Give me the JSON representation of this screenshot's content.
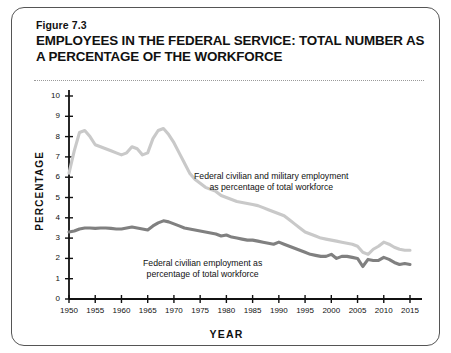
{
  "figure": {
    "number": "Figure 7.3",
    "title": "EMPLOYEES IN THE FEDERAL SERVICE: TOTAL NUMBER AS A PERCENTAGE OF THE WORKFORCE"
  },
  "colors": {
    "total_line": "#c9c9c9",
    "civilian_line": "#808080",
    "axis": "#111111",
    "frame": "#555555",
    "background": "#ffffff"
  },
  "chart_data": {
    "type": "line",
    "title": "EMPLOYEES IN THE FEDERAL SERVICE: TOTAL NUMBER AS A PERCENTAGE OF THE WORKFORCE",
    "xlabel": "YEAR",
    "ylabel": "PERCENTAGE",
    "xlim": [
      1950,
      2015
    ],
    "ylim": [
      0,
      10
    ],
    "grid": false,
    "legend": "annotations-on-plot",
    "xticks": [
      1950,
      1955,
      1960,
      1965,
      1970,
      1975,
      1980,
      1985,
      1990,
      1995,
      2000,
      2005,
      2010,
      2015
    ],
    "yticks": [
      0,
      1,
      2,
      3,
      4,
      5,
      6,
      7,
      8,
      9,
      10
    ],
    "annotations": [
      {
        "name": "total-workforce-label",
        "text_line1": "Federal civilian and military employment",
        "text_line2": "as percentage of total workforce",
        "series": "Federal civilian and military employment as percentage of total workforce"
      },
      {
        "name": "civilian-label",
        "text_line1": "Federal civilian employment as",
        "text_line2": "percentage of total workforce",
        "series": "Federal civilian employment as percentage of total workforce"
      }
    ],
    "series": [
      {
        "name": "Federal civilian and military employment as percentage of total workforce",
        "color": "#c9c9c9",
        "x": [
          1950,
          1951,
          1952,
          1953,
          1954,
          1955,
          1956,
          1957,
          1958,
          1959,
          1960,
          1961,
          1962,
          1963,
          1964,
          1965,
          1966,
          1967,
          1968,
          1969,
          1970,
          1971,
          1972,
          1973,
          1974,
          1975,
          1976,
          1977,
          1978,
          1979,
          1980,
          1981,
          1982,
          1983,
          1984,
          1985,
          1986,
          1987,
          1988,
          1989,
          1990,
          1991,
          1992,
          1993,
          1994,
          1995,
          1996,
          1997,
          1998,
          1999,
          2000,
          2001,
          2002,
          2003,
          2004,
          2005,
          2006,
          2007,
          2008,
          2009,
          2010,
          2011,
          2012,
          2013,
          2014,
          2015
        ],
        "values": [
          6.2,
          7.3,
          8.2,
          8.3,
          8.0,
          7.6,
          7.5,
          7.4,
          7.3,
          7.2,
          7.1,
          7.2,
          7.5,
          7.4,
          7.1,
          7.2,
          7.9,
          8.3,
          8.4,
          8.1,
          7.7,
          7.2,
          6.7,
          6.2,
          5.9,
          5.7,
          5.5,
          5.4,
          5.3,
          5.1,
          5.0,
          4.9,
          4.8,
          4.75,
          4.7,
          4.65,
          4.6,
          4.5,
          4.4,
          4.3,
          4.2,
          4.1,
          3.9,
          3.7,
          3.5,
          3.3,
          3.2,
          3.1,
          3.0,
          2.95,
          2.9,
          2.85,
          2.8,
          2.75,
          2.7,
          2.6,
          2.3,
          2.2,
          2.45,
          2.6,
          2.8,
          2.7,
          2.55,
          2.45,
          2.4,
          2.4
        ]
      },
      {
        "name": "Federal civilian employment as percentage of total workforce",
        "color": "#808080",
        "x": [
          1950,
          1951,
          1952,
          1953,
          1954,
          1955,
          1956,
          1957,
          1958,
          1959,
          1960,
          1961,
          1962,
          1963,
          1964,
          1965,
          1966,
          1967,
          1968,
          1969,
          1970,
          1971,
          1972,
          1973,
          1974,
          1975,
          1976,
          1977,
          1978,
          1979,
          1980,
          1981,
          1982,
          1983,
          1984,
          1985,
          1986,
          1987,
          1988,
          1989,
          1990,
          1991,
          1992,
          1993,
          1994,
          1995,
          1996,
          1997,
          1998,
          1999,
          2000,
          2001,
          2002,
          2003,
          2004,
          2005,
          2006,
          2007,
          2008,
          2009,
          2010,
          2011,
          2012,
          2013,
          2014,
          2015
        ],
        "values": [
          3.3,
          3.35,
          3.45,
          3.5,
          3.5,
          3.48,
          3.5,
          3.5,
          3.48,
          3.45,
          3.45,
          3.5,
          3.55,
          3.5,
          3.45,
          3.4,
          3.6,
          3.75,
          3.85,
          3.8,
          3.7,
          3.6,
          3.5,
          3.45,
          3.4,
          3.35,
          3.3,
          3.25,
          3.2,
          3.1,
          3.15,
          3.05,
          3.0,
          2.95,
          2.9,
          2.9,
          2.85,
          2.8,
          2.75,
          2.7,
          2.8,
          2.7,
          2.6,
          2.5,
          2.4,
          2.3,
          2.2,
          2.15,
          2.1,
          2.1,
          2.2,
          2.0,
          2.1,
          2.1,
          2.05,
          2.0,
          1.6,
          1.95,
          1.9,
          1.9,
          2.05,
          1.95,
          1.8,
          1.7,
          1.75,
          1.7
        ]
      }
    ]
  }
}
